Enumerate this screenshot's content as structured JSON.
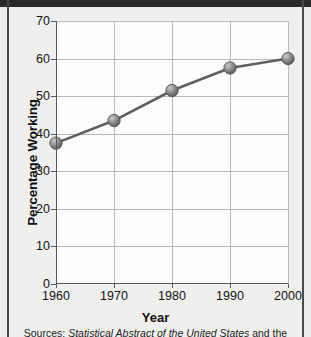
{
  "chart_data": {
    "type": "line",
    "title": "",
    "xlabel": "Year",
    "ylabel": "Percentage Working",
    "x": [
      1960,
      1970,
      1980,
      1990,
      2000
    ],
    "categories": [
      "1960",
      "1970",
      "1980",
      "1990",
      "2000"
    ],
    "values": [
      37.5,
      43.5,
      51.5,
      57.5,
      60
    ],
    "series": [
      {
        "name": "Percentage Working",
        "values": [
          37.5,
          43.5,
          51.5,
          57.5,
          60
        ]
      }
    ],
    "xlim": [
      1960,
      2000
    ],
    "ylim": [
      0,
      70
    ],
    "ytick_labels": [
      "0",
      "10",
      "20",
      "30",
      "40",
      "50",
      "60",
      "70"
    ],
    "ytick_values": [
      0,
      10,
      20,
      30,
      40,
      50,
      60,
      70
    ],
    "xtick_labels": [
      "1960",
      "1970",
      "1980",
      "1990",
      "2000"
    ],
    "xtick_values": [
      1960,
      1970,
      1980,
      1990,
      2000
    ],
    "grid": "both",
    "legend": "none",
    "marker": "sphere",
    "line_color": "#5f5f5f",
    "marker_color": "#8a8a8a",
    "plot_background": "#fcfcfc",
    "grid_color": "#b9b9b9"
  },
  "source_note": {
    "prefix": "Sources:",
    "italic_title": "Statistical Abstract of the United States",
    "suffix": "and the"
  },
  "figure": {
    "background": "#efefed",
    "frame_color": "#2b2b2b"
  }
}
